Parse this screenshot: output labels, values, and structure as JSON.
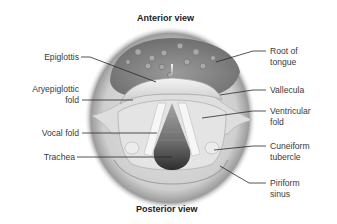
{
  "diagram": {
    "title_top": "Anterior view",
    "title_bottom": "Posterior view",
    "labels_left": [
      {
        "id": "epiglottis",
        "text": "Epiglottis"
      },
      {
        "id": "aryepiglottic-fold",
        "text": "Aryepiglottic fold"
      },
      {
        "id": "vocal-fold",
        "text": "Vocal fold"
      },
      {
        "id": "trachea",
        "text": "Trachea"
      }
    ],
    "labels_right": [
      {
        "id": "root-of-tongue",
        "text": "Root of tongue"
      },
      {
        "id": "vallecula",
        "text": "Vallecula"
      },
      {
        "id": "ventricular-fold",
        "text": "Ventricular fold"
      },
      {
        "id": "cuneiform-tubercle",
        "text": "Cuneiform tubercle"
      },
      {
        "id": "piriform-sinus",
        "text": "Piriform sinus"
      }
    ],
    "colors": {
      "background": "#ffffff",
      "tongue": "#8a8a8a",
      "tissue": "#d9d9d9",
      "glottis": "#4a4a4a",
      "leader_line": "#2a2a2a",
      "text": "#3a3a3a"
    }
  }
}
